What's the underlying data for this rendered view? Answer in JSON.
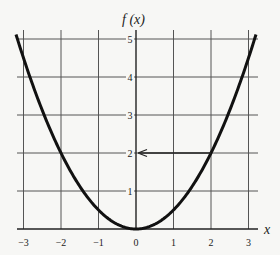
{
  "chart_data": {
    "type": "line",
    "title": "",
    "xlabel": "x",
    "ylabel": "f (x)",
    "xlim": [
      -3.2,
      3.2
    ],
    "ylim": [
      0,
      5.2
    ],
    "grid": true,
    "x_ticks": [
      -3,
      -2,
      -1,
      0,
      1,
      2,
      3
    ],
    "x_tick_labels": [
      "−3",
      "−2",
      "−1",
      "0",
      "1",
      "2",
      "3"
    ],
    "y_ticks": [
      1,
      2,
      3,
      4,
      5
    ],
    "y_tick_labels": [
      "1",
      "2",
      "3",
      "4",
      "5"
    ],
    "series": [
      {
        "name": "f(x) = x²/2",
        "x": [
          -3.2,
          -3,
          -2.5,
          -2,
          -1.5,
          -1,
          -0.5,
          0,
          0.5,
          1,
          1.5,
          2,
          2.5,
          3,
          3.2
        ],
        "values": [
          5.12,
          4.5,
          3.125,
          2,
          1.125,
          0.5,
          0.125,
          0,
          0.125,
          0.5,
          1.125,
          2,
          3.125,
          4.5,
          5.12
        ]
      }
    ],
    "annotations": [
      {
        "type": "arrow",
        "from": [
          2,
          2
        ],
        "to": [
          0,
          2
        ],
        "description": "horizontal arrow from the point (2, 2) on the curve to the f(x) axis at 2"
      }
    ]
  },
  "labels": {
    "x_axis": "x",
    "y_axis": "f (x)"
  }
}
